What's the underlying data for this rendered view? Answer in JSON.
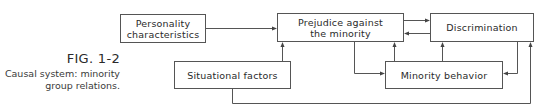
{
  "figure": {
    "label": "FIG. 1-2",
    "caption_line1": "Causal system: minority",
    "caption_line2": "group relations."
  },
  "nodes": {
    "personality": {
      "line1": "Personality",
      "line2": "characteristics"
    },
    "prejudice": {
      "line1": "Prejudice against",
      "line2": "the minority"
    },
    "discrimination": {
      "label": "Discrimination"
    },
    "situational": {
      "label": "Situational factors"
    },
    "minority_behavior": {
      "label": "Minority behavior"
    }
  },
  "edges": [
    {
      "from": "Personality characteristics",
      "to": "Prejudice against the minority"
    },
    {
      "from": "Situational factors",
      "to": "Prejudice against the minority"
    },
    {
      "from": "Prejudice against the minority",
      "to": "Discrimination"
    },
    {
      "from": "Discrimination",
      "to": "Prejudice against the minority"
    },
    {
      "from": "Prejudice against the minority",
      "to": "Minority behavior"
    },
    {
      "from": "Minority behavior",
      "to": "Prejudice against the minority"
    },
    {
      "from": "Minority behavior",
      "to": "Discrimination"
    },
    {
      "from": "Discrimination",
      "to": "Minority behavior"
    },
    {
      "from": "Situational factors",
      "to": "Discrimination"
    }
  ]
}
